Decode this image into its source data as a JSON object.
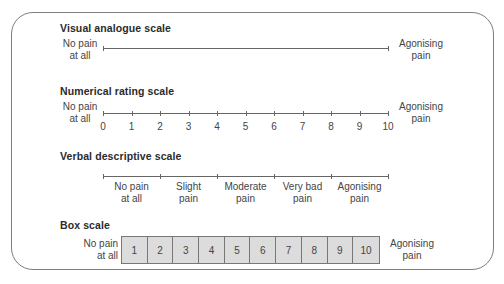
{
  "vas": {
    "title": "Visual analogue scale",
    "left_line1": "No pain",
    "left_line2": "at all",
    "right_line1": "Agonising",
    "right_line2": "pain"
  },
  "nrs": {
    "title": "Numerical rating scale",
    "left_line1": "No pain",
    "left_line2": "at all",
    "right_line1": "Agonising",
    "right_line2": "pain",
    "numbers": [
      "0",
      "1",
      "2",
      "3",
      "4",
      "5",
      "6",
      "7",
      "8",
      "9",
      "10"
    ]
  },
  "vds": {
    "title": "Verbal descriptive scale",
    "items": [
      {
        "line1": "No pain",
        "line2": "at all"
      },
      {
        "line1": "Slight",
        "line2": "pain"
      },
      {
        "line1": "Moderate",
        "line2": "pain"
      },
      {
        "line1": "Very bad",
        "line2": "pain"
      },
      {
        "line1": "Agonising",
        "line2": "pain"
      }
    ]
  },
  "box": {
    "title": "Box scale",
    "left_line1": "No pain",
    "left_line2": "at all",
    "right_line1": "Agonising",
    "right_line2": "pain",
    "boxes": [
      "1",
      "2",
      "3",
      "4",
      "5",
      "6",
      "7",
      "8",
      "9",
      "10"
    ]
  },
  "colors": {
    "frame": "#7d7d7d",
    "box_fill": "#dcdcdc",
    "text": "#444444"
  }
}
